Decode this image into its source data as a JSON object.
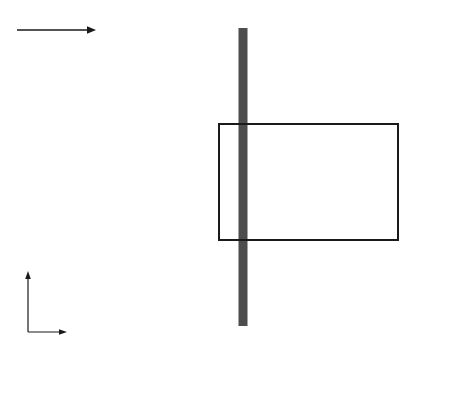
{
  "figure": {
    "flow_label": "来流方向",
    "axis_x_label": "X",
    "axis_y_label": "Y",
    "colors": {
      "building_fill": "#b3b3b3",
      "tower_fill": "#4d4d4d",
      "measure_dot": "#2b2b2b",
      "measure_dot_light": "#8a8a8a",
      "region_border": "#1a1a1a",
      "gridline": "#c9c9d4",
      "axis": "#1a1a1a"
    }
  },
  "chart_data": {
    "type": "scatter",
    "title": "",
    "xlabel": "X",
    "ylabel": "Y",
    "grid": true,
    "legend": null,
    "xlim": [
      -240,
      420
    ],
    "ylim": [
      -210,
      210
    ],
    "xticks": [
      -210,
      -150,
      -120,
      -90,
      -60,
      -30,
      0,
      30,
      90,
      150,
      210,
      270,
      330,
      390
    ],
    "xtick_labels": [
      "-210",
      "-150",
      "-120",
      "-90",
      "-30",
      "-60",
      "0",
      "30",
      "90",
      "150",
      "210",
      "270",
      "330",
      "390"
    ],
    "yticks": [
      180,
      120,
      60,
      30,
      0,
      -30,
      -60,
      -120,
      -180
    ],
    "ytick_labels": [
      "180",
      "120",
      "60",
      "30",
      "0",
      "-30",
      "-60",
      "-120",
      "-180"
    ],
    "region_of_interest": {
      "x0": -210,
      "x1": 390,
      "y0": -180,
      "y1": 180
    },
    "building_array": {
      "note": "square building blocks, regular staggered array",
      "block_size_px": 23,
      "pitch_x_px": 50,
      "pitch_y_px": 52,
      "cols": 10,
      "rows": 9
    },
    "tower": {
      "x": 0,
      "label": "central tower strip"
    },
    "series": [
      {
        "name": "measurement points y=180",
        "x": [
          -210,
          -150,
          -90,
          -30,
          30,
          90
        ],
        "y": [
          180,
          180,
          180,
          180,
          180,
          180
        ]
      },
      {
        "name": "measurement points y=120",
        "x": [
          -60,
          30
        ],
        "y": [
          120,
          120
        ]
      },
      {
        "name": "measurement points y=60",
        "x": [
          -210,
          -180,
          -150,
          -120,
          -90,
          -60,
          -30,
          30,
          90,
          150,
          210,
          270,
          330
        ],
        "y": [
          60,
          60,
          60,
          60,
          60,
          60,
          60,
          60,
          60,
          60,
          60,
          60,
          60
        ]
      },
      {
        "name": "measurement points y=30",
        "x": [
          -210,
          -180,
          -150,
          -120,
          -90,
          -60,
          -30
        ],
        "y": [
          30,
          30,
          30,
          30,
          30,
          30,
          30
        ]
      },
      {
        "name": "measurement points y=0",
        "x": [
          -210,
          -180,
          -150,
          -120,
          -90,
          -60,
          -30,
          30,
          90,
          150,
          210,
          270,
          330
        ],
        "y": [
          0,
          0,
          0,
          0,
          0,
          0,
          0,
          0,
          0,
          0,
          0,
          0,
          0
        ]
      },
      {
        "name": "measurement points y=-30",
        "x": [
          -210,
          -180,
          -150,
          -120,
          -90,
          -60,
          -30
        ],
        "y": [
          -30,
          -30,
          -30,
          -30,
          -30,
          -30,
          -30
        ]
      },
      {
        "name": "measurement points y=-60",
        "x": [
          -210,
          -180,
          -150,
          -120,
          -90,
          -60,
          -30,
          30,
          90,
          150
        ],
        "y": [
          -60,
          -60,
          -60,
          -60,
          -60,
          -60,
          -60,
          -60,
          -60,
          -60
        ]
      },
      {
        "name": "measurement points y=-120",
        "x": [
          -60,
          30
        ],
        "y": [
          -120,
          -120
        ]
      },
      {
        "name": "measurement points y=-180",
        "x": [
          -210,
          -150,
          -90,
          -30,
          30,
          90
        ],
        "y": [
          -180,
          -180,
          -180,
          -180,
          -180,
          -180
        ]
      }
    ]
  }
}
